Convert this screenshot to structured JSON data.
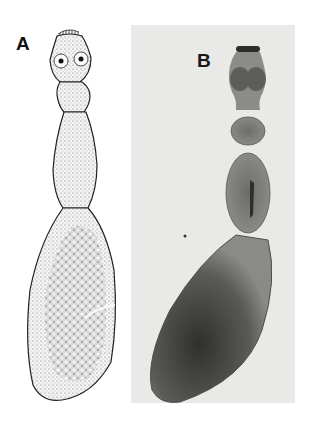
{
  "figure": {
    "panels": [
      {
        "label": "A",
        "type": "line drawing (stippled illustration)",
        "subject": "elongated organism with head bearing hooks and suckers, segmented neck and large oval posterior segment"
      },
      {
        "label": "B",
        "type": "grayscale micrograph",
        "subject": "same organism photographed, showing scolex, neck segments and large gravid posterior segment"
      }
    ]
  },
  "colors": {
    "background": "#ffffff",
    "photo_background": "#e9e9e7",
    "drawing_fill": "#efefef",
    "photo_body": "#7a7a78",
    "photo_dark": "#3a3a38"
  }
}
